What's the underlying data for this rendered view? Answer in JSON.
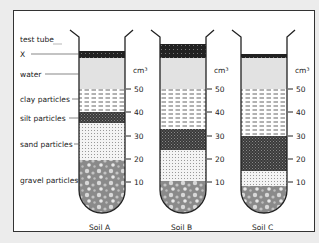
{
  "labels": {
    "test_tube": "test tube",
    "x": "X",
    "water": "water",
    "clay": "clay particles",
    "silt": "silt particles",
    "sand": "sand particles",
    "gravel": "gravel particles"
  },
  "unit": "cm³",
  "scale_ticks": [
    "50",
    "40",
    "30",
    "20",
    "10"
  ],
  "tubes": [
    {
      "name": "Soil A",
      "layers": {
        "gravel": [
          0,
          20
        ],
        "sand": [
          20,
          36
        ],
        "silt": [
          36,
          40
        ],
        "clay": [
          40,
          50
        ],
        "water": [
          50,
          66
        ],
        "x": [
          66,
          68
        ]
      }
    },
    {
      "name": "Soil B",
      "layers": {
        "gravel": [
          0,
          10
        ],
        "sand": [
          10,
          24
        ],
        "silt": [
          24,
          32
        ],
        "clay": [
          32,
          50
        ],
        "water": [
          50,
          66
        ],
        "x": [
          66,
          71
        ]
      }
    },
    {
      "name": "Soil C",
      "layers": {
        "gravel": [
          0,
          7
        ],
        "sand": [
          7,
          13
        ],
        "silt": [
          13,
          30
        ],
        "clay": [
          30,
          50
        ],
        "water": [
          50,
          66
        ],
        "x": [
          66,
          67
        ]
      }
    }
  ],
  "colors": {
    "water": "#e2e2e2",
    "silt": "#3a3a3a",
    "gravel": "#8a8a8a",
    "outline": "#222222"
  }
}
